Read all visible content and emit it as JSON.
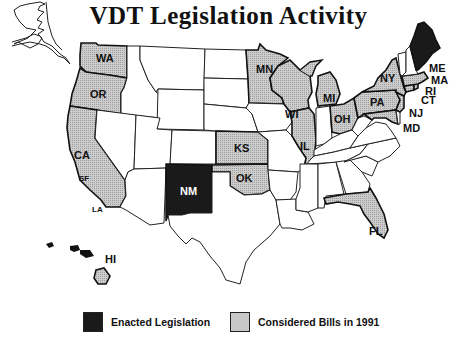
{
  "title": "VDT Legislation Activity",
  "legend": {
    "enacted": {
      "label": "Enacted Legislation",
      "color": "#1a1a1a"
    },
    "considered": {
      "label": "Considered Bills in 1991",
      "color": "#c8c8c8"
    }
  },
  "states": {
    "enacted": [
      "ME",
      "NM"
    ],
    "considered": [
      "WA",
      "OR",
      "CA",
      "MN",
      "WI",
      "MI",
      "IL",
      "OH",
      "NY",
      "PA",
      "MA",
      "RI",
      "CT",
      "NJ",
      "MD",
      "KS",
      "OK",
      "FL",
      "HI"
    ]
  },
  "labels": {
    "WA": "WA",
    "OR": "OR",
    "CA": "CA",
    "SF": "SF",
    "LA": "LA",
    "MN": "MN",
    "WI": "WI",
    "MI": "MI",
    "IL": "IL",
    "OH": "OH",
    "NY": "NY",
    "PA": "PA",
    "ME": "ME",
    "MA": "MA",
    "RI": "RI",
    "CT": "CT",
    "NJ": "NJ",
    "MD": "MD",
    "KS": "KS",
    "OK": "OK",
    "NM": "NM",
    "FL": "FL",
    "HI": "HI"
  },
  "notes": {
    "cities": [
      "SF",
      "LA"
    ]
  }
}
